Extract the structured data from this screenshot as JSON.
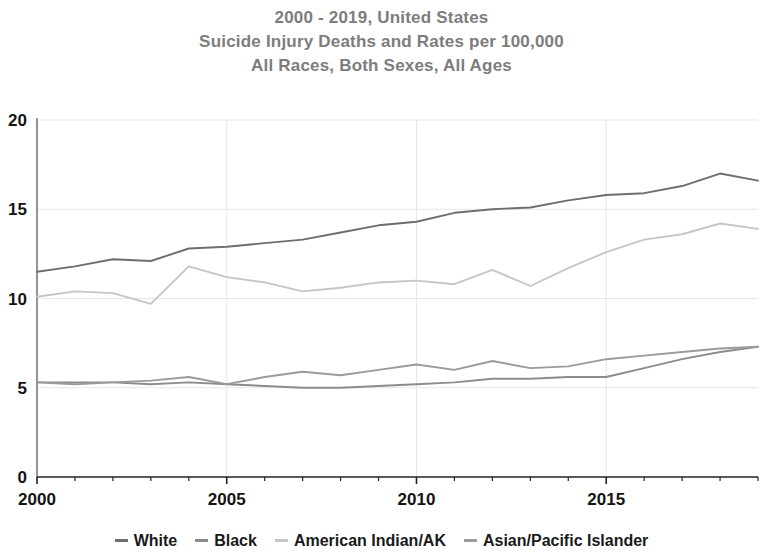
{
  "chart_data": {
    "type": "line",
    "title": "2000 - 2019, United States\nSuicide Injury Deaths and Rates per 100,000\nAll Races, Both Sexes, All Ages",
    "title_lines": [
      "2000 - 2019, United States",
      "Suicide Injury Deaths and Rates per 100,000",
      "All Races, Both Sexes, All Ages"
    ],
    "xlabel": "",
    "ylabel": "",
    "xlim": [
      2000,
      2019
    ],
    "ylim": [
      0,
      20
    ],
    "x": [
      2000,
      2001,
      2002,
      2003,
      2004,
      2005,
      2006,
      2007,
      2008,
      2009,
      2010,
      2011,
      2012,
      2013,
      2014,
      2015,
      2016,
      2017,
      2018,
      2019
    ],
    "x_ticks": [
      2000,
      2005,
      2010,
      2015
    ],
    "x_tick_labels": [
      "2000",
      "2005",
      "2010",
      "2015"
    ],
    "x_minor_ticks": [
      2001,
      2002,
      2003,
      2004,
      2006,
      2007,
      2008,
      2009,
      2011,
      2012,
      2013,
      2014,
      2016,
      2017,
      2018,
      2019
    ],
    "y_ticks": [
      0,
      5,
      10,
      15,
      20
    ],
    "y_tick_labels": [
      "0",
      "5",
      "10",
      "15",
      "20"
    ],
    "grid": true,
    "legend_position": "bottom",
    "series": [
      {
        "name": "White",
        "color": "#6e6e6e",
        "values": [
          11.5,
          11.8,
          12.2,
          12.1,
          12.8,
          12.9,
          13.1,
          13.3,
          13.7,
          14.1,
          14.3,
          14.8,
          15.0,
          15.1,
          15.5,
          15.8,
          15.9,
          16.3,
          17.0,
          16.6
        ]
      },
      {
        "name": "Black",
        "color": "#8c8c8c",
        "values": [
          5.3,
          5.3,
          5.3,
          5.2,
          5.3,
          5.2,
          5.1,
          5.0,
          5.0,
          5.1,
          5.2,
          5.3,
          5.5,
          5.5,
          5.6,
          5.6,
          6.1,
          6.6,
          7.0,
          7.3
        ]
      },
      {
        "name": "American Indian/AK",
        "color": "#c6c6c6",
        "values": [
          10.1,
          10.4,
          10.3,
          9.7,
          11.8,
          11.2,
          10.9,
          10.4,
          10.6,
          10.9,
          11.0,
          10.8,
          11.6,
          10.7,
          11.7,
          12.6,
          13.3,
          13.6,
          14.2,
          13.9
        ]
      },
      {
        "name": "Asian/Pacific Islander",
        "color": "#9a9a9a",
        "values": [
          5.3,
          5.2,
          5.3,
          5.4,
          5.6,
          5.2,
          5.6,
          5.9,
          5.7,
          6.0,
          6.3,
          6.0,
          6.5,
          6.1,
          6.2,
          6.6,
          6.8,
          7.0,
          7.2,
          7.3
        ]
      }
    ]
  },
  "legend": {
    "items": [
      {
        "label": "White",
        "marker": "line-dash-marker"
      },
      {
        "label": "Black",
        "marker": "line-dash-marker"
      },
      {
        "label": "American Indian/AK",
        "marker": "line-dash-marker"
      },
      {
        "label": "Asian/Pacific Islander",
        "marker": "line-dash-marker"
      }
    ]
  },
  "colors": {
    "title": "#7d7d7d",
    "axis": "#333333",
    "grid": "#e6e6e6",
    "tick_text": "#141414",
    "background": "#ffffff"
  }
}
